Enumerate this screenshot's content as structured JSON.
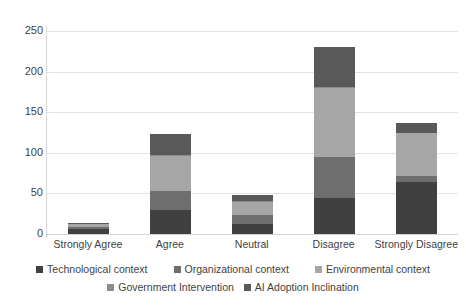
{
  "chart_data": {
    "type": "bar",
    "subtype": "stacked-column",
    "title": "",
    "xlabel": "",
    "ylabel": "",
    "ylim": [
      0,
      250
    ],
    "ytick_step": 50,
    "yticks": [
      0,
      50,
      100,
      150,
      200,
      250
    ],
    "ytick_labels": [
      "0",
      "50",
      "100",
      "150",
      "200",
      "250"
    ],
    "grid": true,
    "grid_axis": "y",
    "legend_position": "bottom",
    "categories": [
      "Strongly Agree",
      "Agree",
      "Neutral",
      "Disagree",
      "Strongly Disagree"
    ],
    "series": [
      {
        "name": "Technological context",
        "color": "#404040",
        "values": [
          6,
          29,
          12,
          44,
          64
        ]
      },
      {
        "name": "Organizational context",
        "color": "#6e6e6e",
        "values": [
          3,
          24,
          11,
          51,
          8
        ]
      },
      {
        "name": "Environmental context",
        "color": "#a6a6a6",
        "values": [
          3,
          43,
          17,
          85,
          52
        ]
      },
      {
        "name": "Government Intervention",
        "color": "#8c8c8c",
        "values": [
          1,
          1,
          1,
          1,
          1
        ]
      },
      {
        "name": "AI Adoption Inclination",
        "color": "#595959",
        "values": [
          1,
          26,
          7,
          49,
          12
        ]
      }
    ],
    "totals": [
      14,
      123,
      48,
      230,
      137
    ],
    "axis_color": "#d9d9d9",
    "gridline_color": "#e2e2e2",
    "text_color": "#3f3f3f",
    "background": "#ffffff"
  },
  "legend": {
    "row1": [
      {
        "label": "Technological context"
      },
      {
        "label": "Organizational context"
      },
      {
        "label": "Environmental context"
      }
    ],
    "row2": [
      {
        "label": "Government Intervention"
      },
      {
        "label": "AI Adoption Inclination"
      }
    ]
  }
}
